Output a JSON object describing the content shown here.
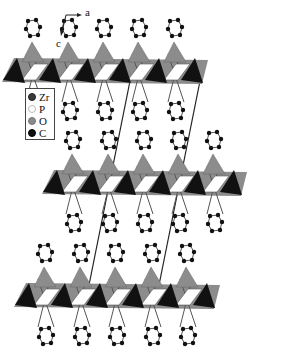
{
  "figure": {
    "axes": {
      "horizontal_label": "a",
      "vertical_label": "c"
    },
    "legend": {
      "items": [
        {
          "label": "Zr",
          "color": "#3a3a3a",
          "border": "#222222"
        },
        {
          "label": "P",
          "color": "#ffffff",
          "border": "#aaaaaa"
        },
        {
          "label": "O",
          "color": "#8a8a8a",
          "border": "#777777"
        },
        {
          "label": "C",
          "color": "#111111",
          "border": "#000000"
        }
      ]
    },
    "colors": {
      "zr_octahedron": "#111111",
      "o_face": "#8c8c8c",
      "p_tetrahedron": "#ffffff",
      "carbon": "#111111",
      "bond": "#555555",
      "cell_edge": "#222222"
    },
    "layers": [
      {
        "band_top": 58,
        "band_bottom": 82,
        "columns": [
          32,
          68,
          103,
          138,
          174
        ]
      },
      {
        "band_top": 170,
        "band_bottom": 194,
        "columns": [
          72,
          108,
          143,
          178,
          213
        ]
      },
      {
        "band_top": 283,
        "band_bottom": 307,
        "columns": [
          44,
          80,
          115,
          151,
          186
        ]
      }
    ],
    "unit_cell_lines": [
      {
        "x1": 131,
        "y1": 76,
        "x2": 86,
        "y2": 300
      },
      {
        "x1": 201,
        "y1": 76,
        "x2": 156,
        "y2": 300
      }
    ]
  }
}
